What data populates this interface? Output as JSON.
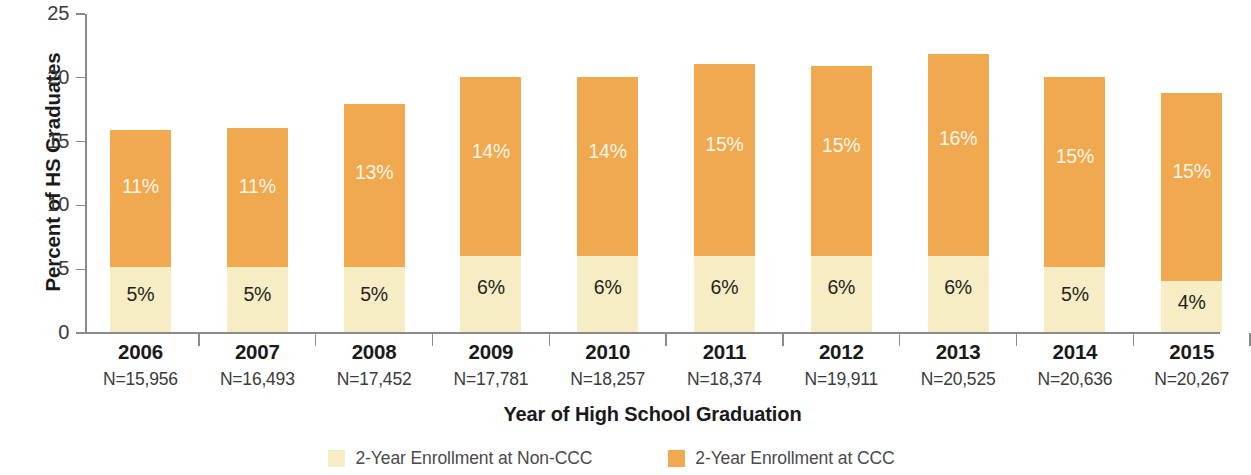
{
  "chart_data": {
    "type": "bar",
    "subtype": "stacked",
    "title": "",
    "xlabel": "Year of High School Graduation",
    "ylabel": "Percent of HS Graduates",
    "ylim": [
      0,
      25
    ],
    "yticks": [
      0,
      5,
      10,
      15,
      20,
      25
    ],
    "ytick_labels": [
      "0",
      "5",
      "10",
      "15",
      "20",
      "25"
    ],
    "grid": false,
    "legend_position": "bottom",
    "categories": [
      "2006",
      "2007",
      "2008",
      "2009",
      "2010",
      "2011",
      "2012",
      "2013",
      "2014",
      "2015"
    ],
    "category_sublabels": [
      "N=15,956",
      "N=16,493",
      "N=17,452",
      "N=17,781",
      "N=18,257",
      "N=18,374",
      "N=19,911",
      "N=20,525",
      "N=20,636",
      "N=20,267"
    ],
    "series": [
      {
        "name": "2-Year Enrollment at Non-CCC",
        "color": "#f7edc4",
        "label_color": "#231f20",
        "values": [
          5.1,
          5.1,
          5.1,
          6.0,
          6.0,
          6.0,
          6.0,
          6.0,
          5.1,
          4.0
        ],
        "data_labels": [
          "5%",
          "5%",
          "5%",
          "6%",
          "6%",
          "6%",
          "6%",
          "6%",
          "5%",
          "4%"
        ]
      },
      {
        "name": "2-Year Enrollment at CCC",
        "color": "#f0a94e",
        "label_color": "#fdf6ea",
        "values": [
          10.8,
          10.9,
          12.8,
          14.0,
          14.0,
          15.0,
          14.9,
          15.8,
          14.9,
          14.8
        ],
        "data_labels": [
          "11%",
          "11%",
          "13%",
          "14%",
          "14%",
          "15%",
          "15%",
          "16%",
          "15%",
          "15%"
        ]
      }
    ],
    "totals": [
      15.9,
      16.0,
      17.9,
      20.0,
      20.0,
      21.0,
      20.9,
      21.8,
      20.0,
      18.8
    ]
  },
  "legend": {
    "items": [
      {
        "label": "2-Year Enrollment at Non-CCC",
        "color": "#f7edc4"
      },
      {
        "label": "2-Year Enrollment at CCC",
        "color": "#f0a94e"
      }
    ]
  }
}
